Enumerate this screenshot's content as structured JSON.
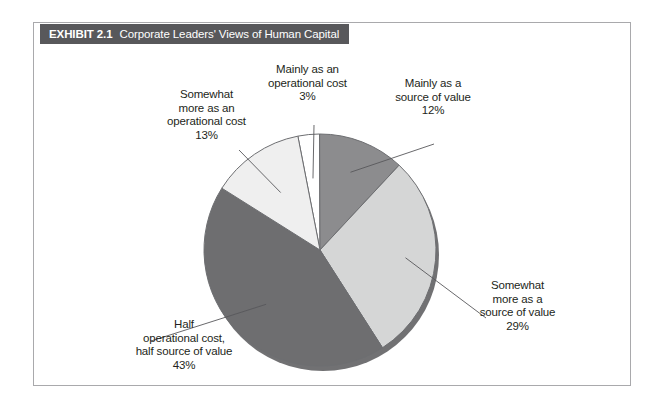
{
  "exhibit": {
    "number": "EXHIBIT 2.1",
    "caption": "Corporate Leaders' Views of Human Capital",
    "title_bar_color": "#58585b",
    "frame_border_color": "#a9a9ac",
    "background_color": "#ffffff",
    "text_color": "#231f20"
  },
  "labels": {
    "mainly_operational": {
      "line1": "Mainly as an",
      "line2": "operational cost",
      "line3": "3%"
    },
    "mainly_source": {
      "line1": "Mainly as a",
      "line2": "source of value",
      "line3": "12%"
    },
    "somewhat_operational": {
      "line1": "Somewhat",
      "line2": "more as an",
      "line3": "operational cost",
      "line4": "13%"
    },
    "somewhat_source": {
      "line1": "Somewhat",
      "line2": "more as a",
      "line3": "source of value",
      "line4": "29%"
    },
    "half_half": {
      "line1": "Half",
      "line2": "operational cost,",
      "line3": "half source of value",
      "line4": "43%"
    }
  },
  "chart_data": {
    "type": "pie",
    "title": "Corporate Leaders' Views of Human Capital",
    "subtitle": "",
    "xlabel": "",
    "ylabel": "",
    "grid": false,
    "legend": "none (direct callout labels with leader lines)",
    "units": "percent",
    "start_angle_deg": -11,
    "direction": "clockwise",
    "categories": [
      "Mainly as an operational cost",
      "Mainly as a source of value",
      "Somewhat more as a source of value",
      "Half operational cost, half source of value",
      "Somewhat more as an operational cost"
    ],
    "values": [
      3,
      12,
      29,
      43,
      13
    ],
    "value_labels": [
      "3%",
      "12%",
      "29%",
      "43%",
      "13%"
    ],
    "colors": [
      "#ffffff",
      "#8c8c8e",
      "#d5d6d6",
      "#6e6e70",
      "#efefef"
    ],
    "slice_edge_color": "#6d6e71",
    "shadow_color": "#58585b"
  }
}
